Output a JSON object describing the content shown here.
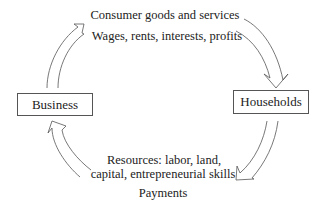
{
  "diagram": {
    "nodes": {
      "business": {
        "label": "Business"
      },
      "households": {
        "label": "Households"
      }
    },
    "flows": {
      "top": {
        "goods_label": "Consumer goods and services",
        "income_label": "Wages, rents, interests, profits"
      },
      "bottom": {
        "resources_line1": "Resources: labor, land,",
        "resources_line2": "capital, entrepreneurial skills",
        "payments_label": "Payments"
      }
    },
    "colors": {
      "stroke": "#555555",
      "text": "#222222",
      "background": "#ffffff"
    }
  }
}
